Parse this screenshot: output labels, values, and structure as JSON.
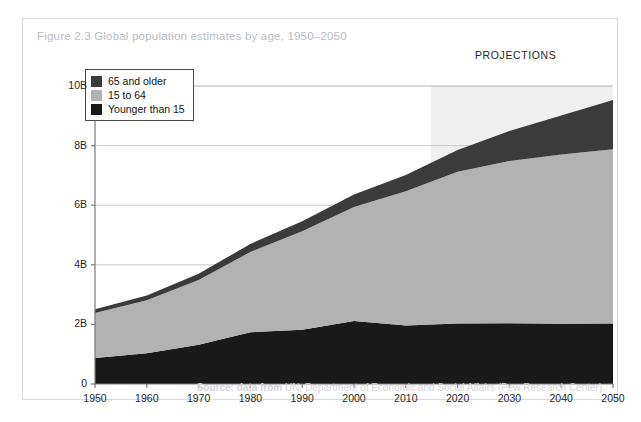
{
  "figure": {
    "title": "Figure 2.3 Global population estimates by age, 1950–2050",
    "projections_label": "PROJECTIONS",
    "source_prefix": "Source: data from",
    "source_rest": " UN, Department of Economic and Social Affairs (Pew Research Center)."
  },
  "colors": {
    "older": "#3b3b3b",
    "working": "#b2b2b2",
    "younger": "#191919",
    "projection_shade": "#efefef",
    "frame": "#d8dade",
    "title_text": "#b9bcc2",
    "source_text": "#d3d5d9",
    "axis": "#7a7a7a",
    "gridline": "#c9c9c9"
  },
  "legend": {
    "items": [
      {
        "label": "65 and older",
        "color": "#3b3b3b"
      },
      {
        "label": "15 to 64",
        "color": "#b2b2b2"
      },
      {
        "label": "Younger than 15",
        "color": "#191919"
      }
    ]
  },
  "chart_data": {
    "type": "area",
    "stacked": true,
    "title": "Figure 2.3 Global population estimates by age, 1950–2050",
    "xlabel": "",
    "ylabel": "",
    "xlim": [
      1950,
      2050
    ],
    "ylim": [
      0,
      10
    ],
    "units": "billions",
    "grid": true,
    "legend_position": "top-left",
    "annotations": [
      {
        "text": "PROJECTIONS",
        "x_start": 2015,
        "x_end": 2050,
        "note": "shaded region 2015–2050 marks projected data"
      }
    ],
    "x": [
      1950,
      1960,
      1970,
      1980,
      1990,
      2000,
      2010,
      2020,
      2030,
      2040,
      2050
    ],
    "xticks": [
      "1950",
      "1960",
      "1970",
      "1980",
      "1990",
      "2000",
      "2010",
      "2020",
      "2030",
      "2040",
      "2050"
    ],
    "yticks": [
      "0",
      "2B",
      "4B",
      "6B",
      "8B",
      "10B"
    ],
    "ytick_values": [
      0,
      2,
      4,
      6,
      8,
      10
    ],
    "series": [
      {
        "name": "Younger than 15",
        "color": "#191919",
        "values": [
          0.87,
          1.03,
          1.32,
          1.74,
          1.82,
          2.11,
          1.96,
          2.03,
          2.04,
          2.02,
          2.03
        ]
      },
      {
        "name": "15 to 64",
        "color": "#b2b2b2",
        "values": [
          1.51,
          1.78,
          2.17,
          2.69,
          3.31,
          3.83,
          4.51,
          5.09,
          5.44,
          5.68,
          5.85
        ]
      },
      {
        "name": "65 and older",
        "color": "#3b3b3b",
        "values": [
          0.13,
          0.16,
          0.21,
          0.27,
          0.33,
          0.42,
          0.54,
          0.73,
          1.01,
          1.31,
          1.65
        ]
      }
    ],
    "totals": [
      2.51,
      2.97,
      3.7,
      4.7,
      5.46,
      6.36,
      7.01,
      7.85,
      8.49,
      9.01,
      9.53
    ]
  },
  "plot_geometry": {
    "left": 72,
    "right": 590,
    "top": 67,
    "bottom": 365,
    "projection_start_x": 408
  }
}
